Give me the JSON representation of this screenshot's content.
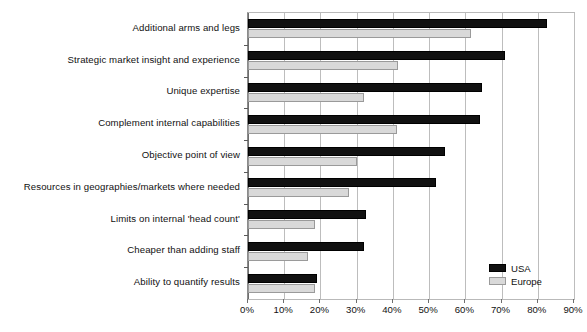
{
  "chart_data": {
    "type": "bar",
    "orientation": "horizontal",
    "title": "",
    "subtitle": "",
    "xlabel": "",
    "ylabel": "",
    "xlim": [
      0,
      90
    ],
    "xtick_labels": [
      "0%",
      "10%",
      "20%",
      "30%",
      "40%",
      "50%",
      "60%",
      "70%",
      "80%",
      "90%"
    ],
    "xtick_values": [
      0,
      10,
      20,
      30,
      40,
      50,
      60,
      70,
      80,
      90
    ],
    "grid": "vertical",
    "legend_position": "bottom-right",
    "categories": [
      "Additional arms and legs",
      "Strategic market insight and experience",
      "Unique expertise",
      "Complement internal capabilities",
      "Objective point of view",
      "Resources in geographies/markets where needed",
      "Limits on internal 'head count'",
      "Cheaper than adding staff",
      "Ability to quantify results"
    ],
    "series": [
      {
        "name": "USA",
        "color": "#111111",
        "values": [
          82.5,
          71,
          64.5,
          64,
          54.5,
          52,
          32.5,
          32,
          19
        ]
      },
      {
        "name": "Europe",
        "color": "#d9d9d9",
        "values": [
          61.5,
          41.5,
          32,
          41,
          30,
          28,
          18.5,
          16.5,
          18.5
        ]
      }
    ]
  },
  "legend": {
    "items": [
      {
        "label": "USA"
      },
      {
        "label": "Europe"
      }
    ]
  }
}
